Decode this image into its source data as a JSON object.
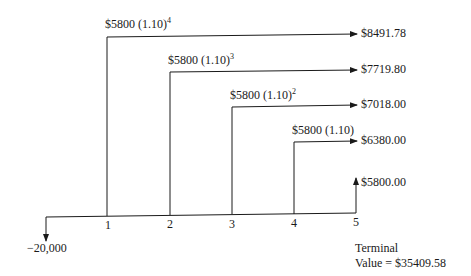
{
  "diagram": {
    "type": "cash-flow-timeline",
    "initial_outflow": "−20,000",
    "periods": [
      "1",
      "2",
      "3",
      "4",
      "5"
    ],
    "flows": [
      {
        "period": "1",
        "base": "$5800 (1.10)",
        "exponent": "4",
        "future_value": "$8491.78"
      },
      {
        "period": "2",
        "base": "$5800 (1.10)",
        "exponent": "3",
        "future_value": "$7719.80"
      },
      {
        "period": "3",
        "base": "$5800 (1.10)",
        "exponent": "2",
        "future_value": "$7018.00"
      },
      {
        "period": "4",
        "base": "$5800 (1.10)",
        "exponent": "",
        "future_value": "$6380.00"
      },
      {
        "period": "5",
        "base": "",
        "exponent": "",
        "future_value": "$5800.00"
      }
    ],
    "terminal_value": {
      "line1": "Terminal",
      "line2": "Value = $35409.58"
    },
    "colors": {
      "line": "#1a1a1a",
      "background": "#ffffff"
    }
  }
}
